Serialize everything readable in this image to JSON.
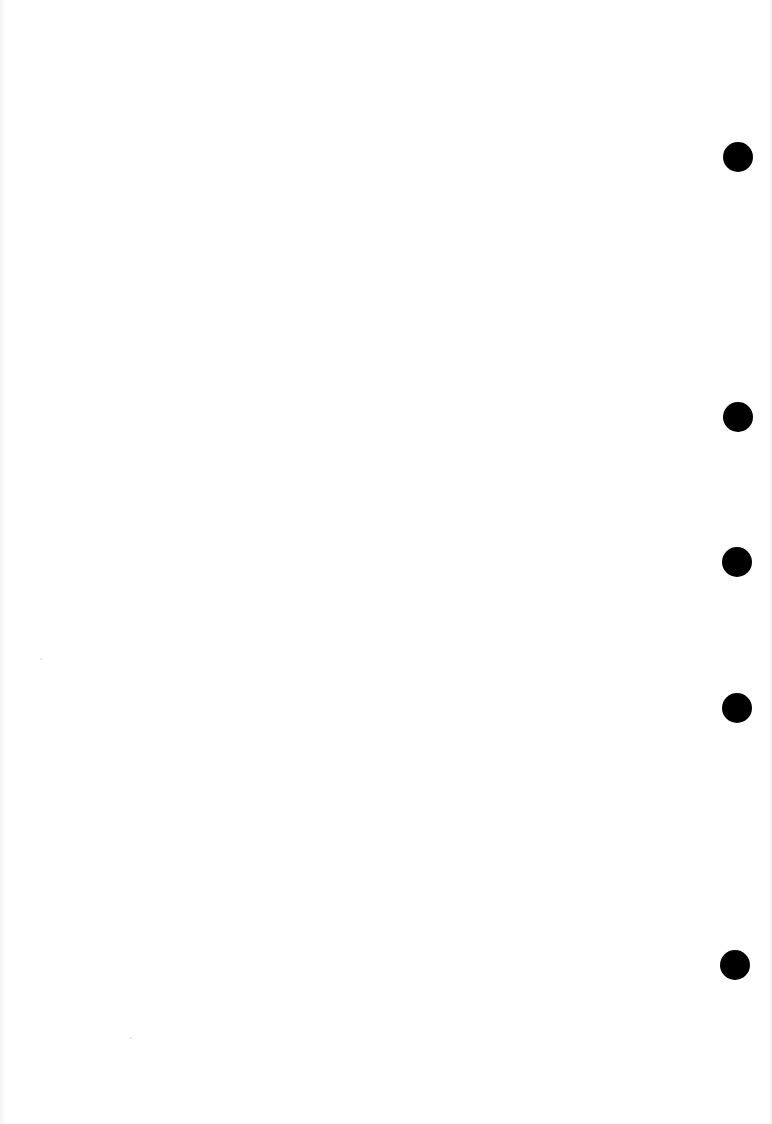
{
  "page": {
    "type": "blank scanned page",
    "background_color": "#ffffff",
    "text": ""
  },
  "punch_holes": {
    "count": 5,
    "color": "#000000",
    "diameter": 30,
    "items": [
      {
        "cx": 738,
        "cy": 157
      },
      {
        "cx": 738,
        "cy": 417
      },
      {
        "cx": 737,
        "cy": 562
      },
      {
        "cx": 737,
        "cy": 708
      },
      {
        "cx": 735,
        "cy": 965
      }
    ]
  }
}
